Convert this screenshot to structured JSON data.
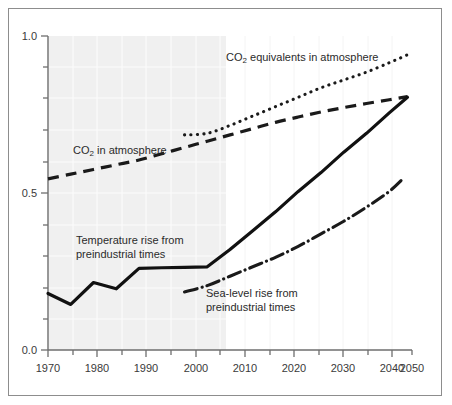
{
  "chart_data": {
    "type": "line",
    "title": "",
    "subtitle": "",
    "xlabel": "",
    "ylabel": "",
    "xlim": [
      1970,
      2050
    ],
    "ylim": [
      0.0,
      1.0
    ],
    "grid": true,
    "legend_position": "inline-annotations",
    "x_ticks_major": [
      1970,
      1980,
      1990,
      2000,
      2010,
      2020,
      2030,
      2040,
      2050
    ],
    "x_tick_labels": [
      "1970",
      "1980",
      "1990",
      "2000",
      "2010",
      "2020",
      "2030",
      "2040",
      "2050"
    ],
    "x_ticks_minor": [
      1975,
      1985,
      1995,
      2005,
      2015,
      2025,
      2035,
      2045
    ],
    "y_ticks_major": [
      0.0,
      0.5,
      1.0
    ],
    "y_tick_labels": [
      "0.0",
      "0.5",
      "1.0"
    ],
    "y_ticks_minor": [
      0.1,
      0.2,
      0.3,
      0.4,
      0.6,
      0.7,
      0.8,
      0.9
    ],
    "shaded_region": {
      "x_start": 1970,
      "x_end": 2010,
      "color": "#f0f0f0",
      "note": "observed period shading"
    },
    "series": [
      {
        "name": "CO2 equivalents in atmosphere",
        "style": "dotted",
        "color": "#1a1a1a",
        "x": [
          2000,
          2005,
          2010,
          2015,
          2020,
          2025,
          2030,
          2035,
          2040,
          2045,
          2049
        ],
        "values": [
          0.685,
          0.69,
          0.715,
          0.745,
          0.775,
          0.805,
          0.835,
          0.86,
          0.885,
          0.915,
          0.94
        ]
      },
      {
        "name": "CO2 in atmosphere",
        "style": "dashed",
        "color": "#1a1a1a",
        "x": [
          1970,
          1975,
          1980,
          1985,
          1990,
          1995,
          2000,
          2005,
          2010,
          2015,
          2020,
          2025,
          2030,
          2035,
          2040,
          2045,
          2049
        ],
        "values": [
          0.545,
          0.56,
          0.575,
          0.59,
          0.605,
          0.625,
          0.645,
          0.665,
          0.685,
          0.705,
          0.725,
          0.742,
          0.758,
          0.772,
          0.785,
          0.797,
          0.807
        ]
      },
      {
        "name": "Temperature rise from preindustrial times",
        "style": "solid",
        "color": "#111111",
        "x": [
          1970,
          1975,
          1980,
          1985,
          1990,
          1995,
          2000,
          2005,
          2010,
          2015,
          2020,
          2025,
          2030,
          2035,
          2040,
          2045,
          2049
        ],
        "values": [
          0.18,
          0.145,
          0.215,
          0.195,
          0.26,
          0.262,
          0.263,
          0.265,
          0.32,
          0.38,
          0.44,
          0.505,
          0.565,
          0.63,
          0.69,
          0.755,
          0.805
        ]
      },
      {
        "name": "Sea-level rise from preindustrial times",
        "style": "dash-dot",
        "color": "#1a1a1a",
        "x": [
          2000,
          2005,
          2010,
          2015,
          2020,
          2025,
          2030,
          2035,
          2040,
          2045,
          2048
        ],
        "values": [
          0.185,
          0.205,
          0.235,
          0.265,
          0.295,
          0.33,
          0.37,
          0.41,
          0.455,
          0.505,
          0.545
        ]
      }
    ],
    "annotations": [
      {
        "id": "co2eq",
        "text_prefix": "CO",
        "text_sub": "2",
        "text_suffix": " equivalents in atmosphere",
        "x_px": 226,
        "y_px": 61
      },
      {
        "id": "co2",
        "text_prefix": "CO",
        "text_sub": "2",
        "text_suffix": " in atmosphere",
        "x_px": 73,
        "y_px": 154
      },
      {
        "id": "temp",
        "line1": "Temperature rise from",
        "line2": "preindustrial times",
        "x_px": 76,
        "y_px": 244
      },
      {
        "id": "sea",
        "line1": "Sea-level rise from",
        "line2": "preindustrial times",
        "x_px": 206,
        "y_px": 297
      }
    ]
  },
  "figure": {
    "border_color": "#8d8d8d",
    "background": "#ffffff",
    "axis_color": "#6e6e6e",
    "grid_color": "#ffffff",
    "tick_label_color": "#3a3a3a"
  }
}
